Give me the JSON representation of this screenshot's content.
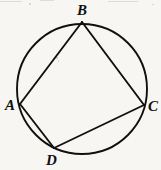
{
  "figure": {
    "type": "geometry-diagram",
    "width": 161,
    "height": 170,
    "background_color": "#f7f6f3",
    "ink_color": "#101010",
    "circle": {
      "name": "circumcircle",
      "center_x": 82,
      "center_y": 89,
      "radius": 65,
      "stroke_width": 1.9
    },
    "vertices": [
      {
        "label": "A",
        "x": 20,
        "y": 104,
        "label_x": 5,
        "label_y": 98
      },
      {
        "label": "B",
        "x": 82,
        "y": 22,
        "label_x": 77,
        "label_y": 3
      },
      {
        "label": "C",
        "x": 144,
        "y": 105,
        "label_x": 148,
        "label_y": 99
      },
      {
        "label": "D",
        "x": 54,
        "y": 148,
        "label_x": 46,
        "label_y": 153
      }
    ],
    "chords": [
      {
        "name": "chord-AB",
        "from": "A",
        "to": "B",
        "x1": 20,
        "y1": 104,
        "x2": 82,
        "y2": 22
      },
      {
        "name": "chord-BC",
        "from": "B",
        "to": "C",
        "x1": 82,
        "y1": 22,
        "x2": 144,
        "y2": 105
      },
      {
        "name": "chord-CD",
        "from": "C",
        "to": "D",
        "x1": 144,
        "y1": 105,
        "x2": 54,
        "y2": 148
      },
      {
        "name": "chord-DA",
        "from": "D",
        "to": "A",
        "x1": 54,
        "y1": 148,
        "x2": 20,
        "y2": 104
      }
    ]
  },
  "labels": {
    "A": "A",
    "B": "B",
    "C": "C",
    "D": "D"
  }
}
